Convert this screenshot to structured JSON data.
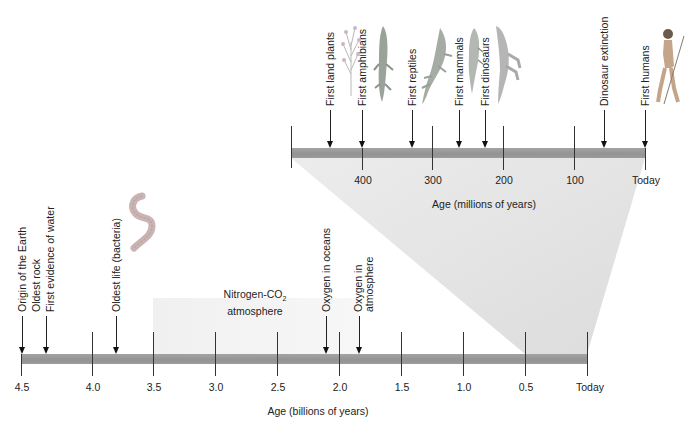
{
  "colors": {
    "bar": "#999999",
    "tick": "#333333",
    "zoom_wedge": "#e6e6e6",
    "atmosphere_region": "#f2f2f2",
    "text": "#222222"
  },
  "top_timeline": {
    "axis_label": "Age (millions of years)",
    "tick_labels": [
      "400",
      "300",
      "200",
      "100",
      "Today"
    ],
    "events": [
      {
        "label": "First land plants",
        "icon": "plant-illustration"
      },
      {
        "label": "First amphibians",
        "icon": "amphibian-illustration"
      },
      {
        "label": "First reptiles",
        "icon": "reptile-illustration"
      },
      {
        "label": "First mammals",
        "icon": "mammal-illustration"
      },
      {
        "label": "First dinosaurs",
        "icon": "dinosaur-illustration"
      },
      {
        "label": "Dinosaur extinction"
      },
      {
        "label": "First humans",
        "icon": "human-illustration"
      }
    ]
  },
  "bottom_timeline": {
    "axis_label": "Age (billions of years)",
    "tick_labels": [
      "4.5",
      "4.0",
      "3.5",
      "3.0",
      "2.5",
      "2.0",
      "1.5",
      "1.0",
      "0.5",
      "Today"
    ],
    "events": [
      {
        "label": "Origin of the Earth"
      },
      {
        "label": "Oldest rock"
      },
      {
        "label": "First evidence of water"
      },
      {
        "label": "Oldest life (bacteria)",
        "icon": "bacteria-illustration"
      },
      {
        "label": "Oxygen in oceans"
      },
      {
        "label": "Oxygen in atmosphere",
        "lines": [
          "Oxygen in",
          "atmosphere"
        ]
      }
    ],
    "region": {
      "label_main": "Nitrogen-CO",
      "label_sub": "2",
      "label_line2": "atmosphere"
    }
  }
}
